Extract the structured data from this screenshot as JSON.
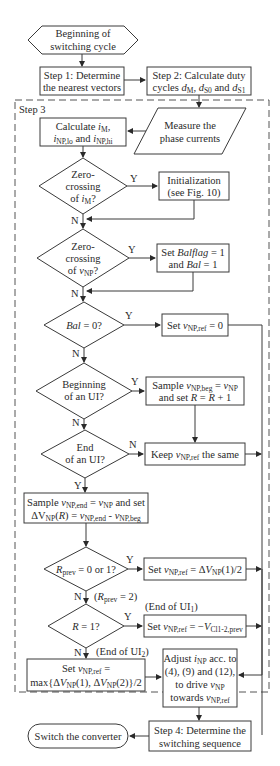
{
  "diagram": {
    "type": "flowchart",
    "step3_label": "Step 3",
    "nodes": {
      "start": {
        "lines": [
          "Beginning of",
          "switching cycle"
        ]
      },
      "step1": {
        "lines": [
          "Step 1: Determine",
          "the nearest vectors"
        ]
      },
      "step2": {
        "lines": [
          "Step 2: Calculate duty",
          "cycles dM, dS0 and dS1"
        ],
        "line1": "Step 2: Calculate duty",
        "l2a": "cycles ",
        "l2b": "d",
        "l2c": "M",
        "l2d": ", ",
        "l2e": "d",
        "l2f": "S0",
        "l2g": " and ",
        "l2h": "d",
        "l2i": "S1"
      },
      "measure": {
        "lines": [
          "Measure the",
          "phase currents"
        ]
      },
      "calc": {
        "l1a": "Calculate ",
        "l1b": "i",
        "l1c": "M",
        "l1d": ",",
        "l2a": "i",
        "l2b": "NP,lo",
        "l2c": " and ",
        "l2d": "i",
        "l2e": "NP,hi"
      },
      "zc_im": {
        "l1": "Zero-",
        "l2": "crossing",
        "l3a": "of ",
        "l3b": "i",
        "l3c": "M",
        "l3d": "?"
      },
      "init": {
        "l1": "Initialization",
        "l2": "(see Fig. 10)"
      },
      "zc_vnp": {
        "l1": "Zero-",
        "l2": "crossing",
        "l3a": "of ",
        "l3b": "v",
        "l3c": "NP",
        "l3d": "?"
      },
      "set_bal": {
        "l1a": "Set ",
        "l1b": "Balflag",
        "l1c": " = 1",
        "l2a": "and ",
        "l2b": "Bal",
        "l2c": " = 1"
      },
      "bal0": {
        "a": "Bal",
        "b": " = 0?"
      },
      "set_ref0": {
        "a": "Set ",
        "b": "v",
        "c": "NP,ref",
        "d": " = 0"
      },
      "begin_ui": {
        "l1": "Beginning",
        "l2": "of an UI?"
      },
      "sample_beg": {
        "l1a": "Sample ",
        "l1b": "v",
        "l1c": "NP,beg",
        "l1d": " = ",
        "l1e": "v",
        "l1f": "NP",
        "l2a": "and set ",
        "l2b": "R",
        "l2c": " = ",
        "l2d": "R",
        "l2e": " + 1"
      },
      "end_ui": {
        "l1": "End",
        "l2": "of an UI?"
      },
      "keep": {
        "a": "Keep ",
        "b": "v",
        "c": "NP,ref",
        "d": " the same"
      },
      "sample_end": {
        "l1a": "Sample ",
        "l1b": "v",
        "l1c": "NP,end",
        "l1d": " = ",
        "l1e": "v",
        "l1f": "NP",
        "l1g": " and set",
        "l2a": "ΔV",
        "l2b": "NP",
        "l2c": "(",
        "l2d": "R",
        "l2e": ") = ",
        "l2f": "v",
        "l2g": "NP,end",
        "l2h": " - ",
        "l2i": "v",
        "l2j": "NP,beg"
      },
      "rprev": {
        "a": "R",
        "b": "prev",
        "c": " = 0 or 1?"
      },
      "set_dv1": {
        "a": "Set ",
        "b": "v",
        "c": "NP,ref",
        "d": " = Δ",
        "e": "V",
        "f": "NP",
        "g": "(1)/2"
      },
      "r1": {
        "a": "R",
        "b": " = 1?"
      },
      "set_vcl": {
        "a": "Set ",
        "b": "v",
        "c": "NP,ref",
        "d": " = −",
        "e": "V",
        "f": "Cl1-2,prev"
      },
      "set_max": {
        "l1a": "Set ",
        "l1b": "v",
        "l1c": "NP,ref",
        "l1d": " =",
        "l2a": "max{Δ",
        "l2b": "V",
        "l2c": "NP",
        "l2d": "(1), Δ",
        "l2e": "V",
        "l2f": "NP",
        "l2g": "(2)}/2"
      },
      "adjust": {
        "l1a": "Adjust ",
        "l1b": "i",
        "l1c": "NP",
        "l1d": " acc. to",
        "l2": "(4), (9) and (12),",
        "l3a": "to drive ",
        "l3b": "v",
        "l3c": "NP",
        "l4a": "towards ",
        "l4b": "v",
        "l4c": "NP,ref"
      },
      "step4": {
        "l1": "Step 4: Determine the",
        "l2": "switching sequence"
      },
      "switch": {
        "label": "Switch the converter"
      }
    },
    "edge_labels": {
      "zc_im_y": "Y",
      "zc_im_n": "N",
      "zc_vnp_y": "Y",
      "zc_vnp_n": "N",
      "bal0_y": "Y",
      "bal0_n": "N",
      "begin_y": "Y",
      "begin_n": "N",
      "end_n": "N",
      "end_y": "Y",
      "rprev_y": "Y",
      "rprev_n": "N",
      "rprev_note_a": "(",
      "rprev_note_b": "R",
      "rprev_note_c": "prev",
      "rprev_note_d": " = 2)",
      "r1_y": "Y",
      "r1_n": "N",
      "end_ui1_a": "(End of UI",
      "end_ui1_b": "1",
      "end_ui1_c": ")",
      "end_ui2_a": "(End of UI",
      "end_ui2_b": "2",
      "end_ui2_c": ")"
    }
  }
}
